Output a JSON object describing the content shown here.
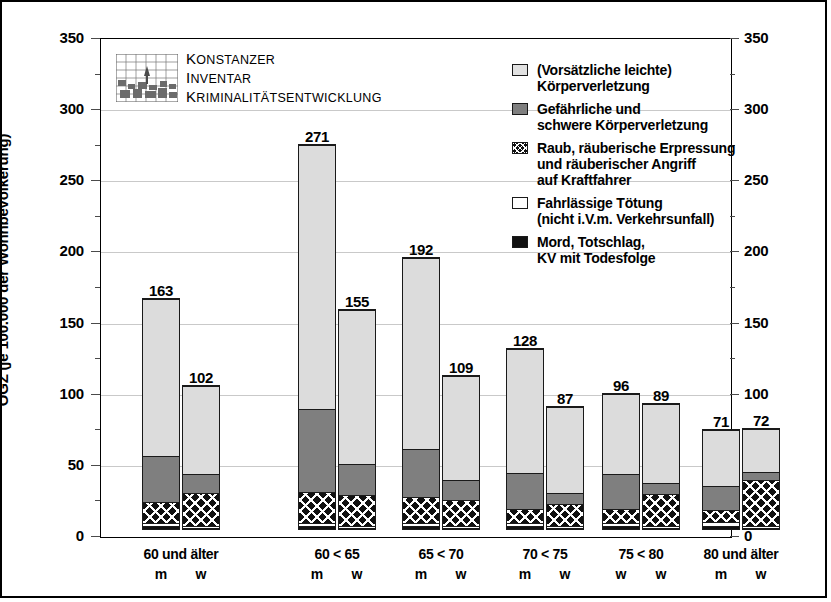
{
  "logo": {
    "line1": "Konstanzer",
    "line2": "Inventar",
    "line3": "Kriminalitätsentwicklung",
    "mark_icon": "konstanz-grid-logo-icon"
  },
  "axes": {
    "y_label": "OGZ (je 100.000 der Wohnbevölkerung)",
    "y_ticks": [
      "0",
      "50",
      "100",
      "150",
      "200",
      "250",
      "300",
      "350"
    ]
  },
  "legend": {
    "items": [
      {
        "swatch": "light-gray-swatch-icon",
        "line1": "(Vorsätzliche leichte)",
        "line2": "Körperverletzung"
      },
      {
        "swatch": "medium-gray-swatch-icon",
        "line1": "Gefährliche und",
        "line2": "schwere Körperverletzung"
      },
      {
        "swatch": "checkered-swatch-icon",
        "line1": "Raub, räuberische Erpressung",
        "line2": "und räuberischer Angriff",
        "line3": "auf Kraftfahrer"
      },
      {
        "swatch": "white-swatch-icon",
        "line1": "Fahrlässige Tötung",
        "line2": "(nicht i.V.m. Verkehrsunfall)"
      },
      {
        "swatch": "black-swatch-icon",
        "line1": "Mord, Totschlag,",
        "line2": "KV mit Todesfolge"
      }
    ]
  },
  "chart_data": {
    "type": "bar",
    "subtype": "stacked",
    "title": "",
    "xlabel": "",
    "ylabel": "OGZ (je 100.000 der Wohnbevölkerung)",
    "ylim": [
      0,
      350
    ],
    "ytick_step": 50,
    "grid": true,
    "legend_position": "top-right",
    "series": [
      {
        "name": "Mord, Totschlag, KV mit Todesfolge",
        "color": "#111111",
        "values": [
          2,
          1,
          2,
          1,
          2,
          1,
          2,
          1,
          2,
          1,
          2,
          1
        ]
      },
      {
        "name": "Fahrlässige Tötung (nicht i.V.m. Verkehrsunfall)",
        "color": "#ffffff",
        "values": [
          2,
          1,
          2,
          1,
          2,
          1,
          2,
          1,
          2,
          1,
          3,
          1
        ]
      },
      {
        "name": "Raub, räuberische Erpressung und räuberischer Angriff auf Kraftfahrer",
        "color": "#111111",
        "values": [
          15,
          24,
          22,
          22,
          19,
          19,
          10,
          16,
          10,
          23,
          9,
          33
        ]
      },
      {
        "name": "Gefährliche und schwere Körperverletzung",
        "color": "#7f7f7f",
        "values": [
          33,
          13,
          59,
          22,
          34,
          14,
          26,
          8,
          25,
          8,
          17,
          6
        ]
      },
      {
        "name": "(Vorsätzliche leichte) Körperverletzung",
        "color": "#dcdcdc",
        "values": [
          111,
          63,
          186,
          109,
          135,
          74,
          89,
          61,
          57,
          56,
          40,
          31
        ]
      }
    ],
    "groups": [
      {
        "label": "60 und älter",
        "bars": [
          {
            "sub_label": "m",
            "total": 163
          },
          {
            "sub_label": "w",
            "total": 102
          }
        ]
      },
      {
        "label": "60 < 65",
        "bars": [
          {
            "sub_label": "m",
            "total": 271
          },
          {
            "sub_label": "w",
            "total": 155
          }
        ]
      },
      {
        "label": "65 < 70",
        "bars": [
          {
            "sub_label": "m",
            "total": 192
          },
          {
            "sub_label": "w",
            "total": 109
          }
        ]
      },
      {
        "label": "70 < 75",
        "bars": [
          {
            "sub_label": "m",
            "total": 128
          },
          {
            "sub_label": "w",
            "total": 87
          }
        ]
      },
      {
        "label": "75 < 80",
        "bars": [
          {
            "sub_label": "w",
            "total": 96
          },
          {
            "sub_label": "w",
            "total": 89
          }
        ]
      },
      {
        "label": "80 und älter",
        "bars": [
          {
            "sub_label": "m",
            "total": 71
          },
          {
            "sub_label": "w",
            "total": 72
          }
        ]
      }
    ]
  }
}
